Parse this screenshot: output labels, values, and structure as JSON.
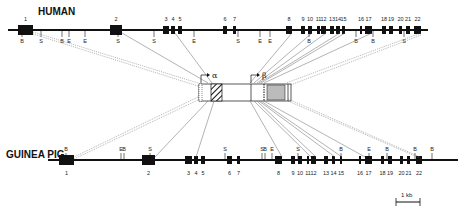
{
  "figure": {
    "human": {
      "label": "HUMAN",
      "exons": [
        {
          "n": "1",
          "x": 18,
          "w": 15
        },
        {
          "n": "2",
          "x": 110,
          "w": 12
        },
        {
          "n": "3",
          "x": 163,
          "w": 6
        },
        {
          "n": "4",
          "x": 171,
          "w": 4
        },
        {
          "n": "5",
          "x": 178,
          "w": 4
        },
        {
          "n": "6",
          "x": 223,
          "w": 4
        },
        {
          "n": "7",
          "x": 233,
          "w": 3
        },
        {
          "n": "8",
          "x": 286,
          "w": 6
        },
        {
          "n": "9",
          "x": 301,
          "w": 4
        },
        {
          "n": "10",
          "x": 308,
          "w": 4
        },
        {
          "n": "11",
          "x": 317,
          "w": 3
        },
        {
          "n": "12",
          "x": 321,
          "w": 5
        },
        {
          "n": "13",
          "x": 330,
          "w": 4
        },
        {
          "n": "14",
          "x": 336,
          "w": 4
        },
        {
          "n": "15",
          "x": 342,
          "w": 3
        },
        {
          "n": "16",
          "x": 360,
          "w": 2
        },
        {
          "n": "17",
          "x": 365,
          "w": 7
        },
        {
          "n": "18",
          "x": 382,
          "w": 4
        },
        {
          "n": "19",
          "x": 389,
          "w": 4
        },
        {
          "n": "20",
          "x": 399,
          "w": 3
        },
        {
          "n": "21",
          "x": 406,
          "w": 4
        },
        {
          "n": "22",
          "x": 414,
          "w": 7
        }
      ],
      "sites": [
        {
          "t": "B",
          "x": 22
        },
        {
          "t": "S",
          "x": 41
        },
        {
          "t": "B",
          "x": 62
        },
        {
          "t": "E",
          "x": 69
        },
        {
          "t": "E",
          "x": 85
        },
        {
          "t": "S",
          "x": 118
        },
        {
          "t": "S",
          "x": 154
        },
        {
          "t": "E",
          "x": 194
        },
        {
          "t": "S",
          "x": 238
        },
        {
          "t": "E",
          "x": 260
        },
        {
          "t": "E",
          "x": 270
        },
        {
          "t": "B",
          "x": 309
        },
        {
          "t": "B",
          "x": 356
        },
        {
          "t": "B",
          "x": 373
        },
        {
          "t": "S",
          "x": 404
        }
      ]
    },
    "guinea_pig": {
      "label": "GUINEA PIG",
      "exons": [
        {
          "n": "1",
          "x": 59,
          "w": 15
        },
        {
          "n": "2",
          "x": 142,
          "w": 13
        },
        {
          "n": "3",
          "x": 185,
          "w": 7
        },
        {
          "n": "4",
          "x": 194,
          "w": 4
        },
        {
          "n": "5",
          "x": 201,
          "w": 4
        },
        {
          "n": "6",
          "x": 227,
          "w": 5
        },
        {
          "n": "7",
          "x": 237,
          "w": 3
        },
        {
          "n": "8",
          "x": 275,
          "w": 7
        },
        {
          "n": "9",
          "x": 291,
          "w": 4
        },
        {
          "n": "10",
          "x": 298,
          "w": 4
        },
        {
          "n": "11",
          "x": 307,
          "w": 2
        },
        {
          "n": "12",
          "x": 311,
          "w": 5
        },
        {
          "n": "13",
          "x": 324,
          "w": 4
        },
        {
          "n": "14",
          "x": 332,
          "w": 3
        },
        {
          "n": "15",
          "x": 340,
          "w": 2
        },
        {
          "n": "16",
          "x": 359,
          "w": 2
        },
        {
          "n": "17",
          "x": 365,
          "w": 7
        },
        {
          "n": "18",
          "x": 381,
          "w": 3
        },
        {
          "n": "19",
          "x": 388,
          "w": 4
        },
        {
          "n": "20",
          "x": 400,
          "w": 3
        },
        {
          "n": "21",
          "x": 407,
          "w": 3
        },
        {
          "n": "22",
          "x": 416,
          "w": 6
        }
      ],
      "sites": [
        {
          "t": "B",
          "x": 66
        },
        {
          "t": "E",
          "x": 121
        },
        {
          "t": "B",
          "x": 124
        },
        {
          "t": "S",
          "x": 150
        },
        {
          "t": "S",
          "x": 225
        },
        {
          "t": "S",
          "x": 262
        },
        {
          "t": "B",
          "x": 265
        },
        {
          "t": "E",
          "x": 272
        },
        {
          "t": "S",
          "x": 298
        },
        {
          "t": "B",
          "x": 341
        },
        {
          "t": "E",
          "x": 369
        },
        {
          "t": "B",
          "x": 387
        },
        {
          "t": "B",
          "x": 415
        },
        {
          "t": "B",
          "x": 432
        }
      ]
    },
    "protein": {
      "alpha_label": "α",
      "beta_label": "β"
    },
    "scale_bar": {
      "label": "1 kb"
    }
  }
}
